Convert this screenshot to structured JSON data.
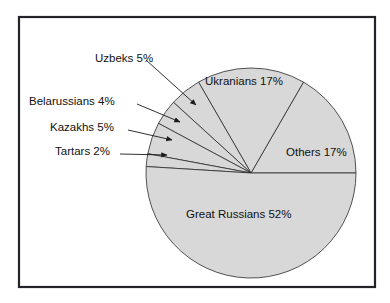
{
  "figure": {
    "background_color": "#ffffff",
    "frame": {
      "x": 19,
      "y": 17,
      "width": 356,
      "height": 270,
      "border_color": "#23232a"
    }
  },
  "chart_data": {
    "type": "pie",
    "title": "",
    "subtitle": "",
    "xlabel": "",
    "ylabel": "",
    "grid": false,
    "legend_position": "none",
    "units": "percent",
    "total": 102,
    "slice_fill_color": "#d8d8d8",
    "slice_outline_color": "#2b2b2b",
    "center": {
      "x": 251,
      "y": 173
    },
    "radius": 105,
    "start_angle_deg": 0,
    "direction": "counterclockwise",
    "categories": [
      "Others",
      "Ukranians",
      "Uzbeks",
      "Belarussians",
      "Kazakhs",
      "Tartars",
      "Great Russians"
    ],
    "values": [
      17,
      17,
      5,
      4,
      5,
      2,
      52
    ],
    "slices": [
      {
        "name": "Others",
        "value": 17,
        "label": "Others 17%",
        "label_placement": "inside",
        "label_x": 286,
        "label_y": 156
      },
      {
        "name": "Ukranians",
        "value": 17,
        "label": "Ukranians 17%",
        "label_placement": "inside",
        "label_x": 205,
        "label_y": 85
      },
      {
        "name": "Uzbeks",
        "value": 5,
        "label": "Uzbeks 5%",
        "label_placement": "callout-left",
        "label_x": 95,
        "label_y": 62,
        "leader_start_x": 146,
        "leader_start_y": 60,
        "leader_end_x": 196,
        "leader_end_y": 105
      },
      {
        "name": "Belarussians",
        "value": 4,
        "label": "Belarussians 4%",
        "label_placement": "callout-left",
        "label_x": 29,
        "label_y": 105,
        "leader_start_x": 137,
        "leader_start_y": 104,
        "leader_end_x": 180,
        "leader_end_y": 122
      },
      {
        "name": "Kazakhs",
        "value": 5,
        "label": "Kazakhs 5%",
        "label_placement": "callout-left",
        "label_x": 50,
        "label_y": 131,
        "leader_start_x": 128,
        "leader_start_y": 130,
        "leader_end_x": 172,
        "leader_end_y": 140
      },
      {
        "name": "Tartars",
        "value": 2,
        "label": "Tartars 2%",
        "label_placement": "callout-left",
        "label_x": 55,
        "label_y": 155,
        "leader_start_x": 120,
        "leader_start_y": 154,
        "leader_end_x": 167,
        "leader_end_y": 155
      },
      {
        "name": "Great Russians",
        "value": 52,
        "label": "Great Russians 52%",
        "label_placement": "inside",
        "label_x": 186,
        "label_y": 218
      }
    ]
  }
}
